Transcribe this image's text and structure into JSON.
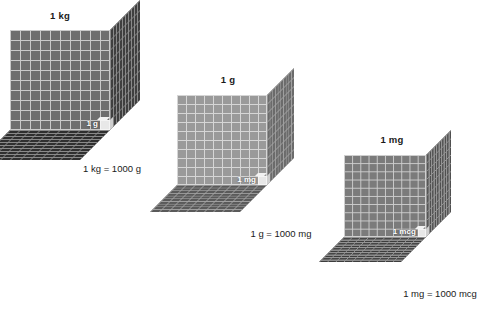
{
  "figure": {
    "background_color": "#ffffff",
    "text_color": "#1a1a1a",
    "unit_label_color": "#ffffff"
  },
  "cubes": [
    {
      "name": "kilogram-cube",
      "title": "1 kg",
      "unit_label": "1 g",
      "caption": "1 kg = 1000 g",
      "front_color": "#6e6e6e",
      "right_color": "#3f3f3f",
      "bottom_color": "#2f2f2f",
      "grid_color": "#c9c9c9",
      "grid_dark_color": "#8a8a8a",
      "divisions": 10,
      "front_left": 10,
      "front_top": 30,
      "front_size": 100,
      "depth": 30,
      "title_center_x": 60,
      "title_top": 10,
      "caption_center_x": 112,
      "caption_top": 163,
      "font_size": 9.5,
      "title_font_size": 9.5,
      "unit_font_size": 8
    },
    {
      "name": "gram-cube",
      "title": "1 g",
      "unit_label": "1 mg",
      "caption": "1 g = 1000 mg",
      "front_color": "#9a9a9a",
      "right_color": "#6b6b6b",
      "bottom_color": "#5a5a5a",
      "grid_color": "#d6d6d6",
      "grid_dark_color": "#a2a2a2",
      "divisions": 10,
      "front_left": 177,
      "front_top": 95,
      "front_size": 90,
      "depth": 27,
      "title_center_x": 228,
      "title_top": 74,
      "caption_center_x": 281,
      "caption_top": 228,
      "font_size": 9.5,
      "title_font_size": 9.5,
      "unit_font_size": 8
    },
    {
      "name": "milligram-cube",
      "title": "1 mg",
      "unit_label": "1 mcg",
      "caption": "1 mg = 1000 mcg",
      "front_color": "#7b7b7b",
      "right_color": "#4f4f4f",
      "bottom_color": "#3d3d3d",
      "grid_color": "#cfcfcf",
      "grid_dark_color": "#949494",
      "divisions": 10,
      "front_left": 344,
      "front_top": 155,
      "front_size": 82,
      "depth": 25,
      "title_center_x": 392,
      "title_top": 134,
      "caption_center_x": 440,
      "caption_top": 288,
      "font_size": 9.5,
      "title_font_size": 9.5,
      "unit_font_size": 8
    }
  ]
}
